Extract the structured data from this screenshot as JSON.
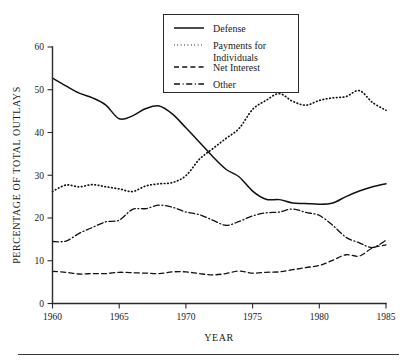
{
  "chart_data": {
    "type": "line",
    "title": "",
    "xlabel": "YEAR",
    "ylabel": "PERCENTAGE OF TOTAL OUTLAYS",
    "xlim": [
      1960,
      1985
    ],
    "ylim": [
      0,
      60
    ],
    "xticks": [
      1960,
      1965,
      1970,
      1975,
      1980,
      1985
    ],
    "xtick_labels": [
      "1960",
      "1965",
      "1970",
      "1975",
      "1980",
      "1985"
    ],
    "yticks": [
      0,
      10,
      20,
      30,
      40,
      50,
      60
    ],
    "ytick_labels": [
      "0",
      "10",
      "20",
      "30",
      "40",
      "50",
      "60"
    ],
    "grid": false,
    "legend_position": "top-center",
    "x": [
      1960,
      1961,
      1962,
      1963,
      1964,
      1965,
      1966,
      1967,
      1968,
      1969,
      1970,
      1971,
      1972,
      1973,
      1974,
      1975,
      1976,
      1977,
      1978,
      1979,
      1980,
      1981,
      1982,
      1983,
      1984,
      1985
    ],
    "series": [
      {
        "name": "Defense",
        "style": "solid",
        "values": [
          52.7,
          50.9,
          49.2,
          48.1,
          46.4,
          43.2,
          43.9,
          45.6,
          46.2,
          44.3,
          41.1,
          37.8,
          34.4,
          31.4,
          29.6,
          26.3,
          24.4,
          24.3,
          23.5,
          23.4,
          23.2,
          23.5,
          25.0,
          26.3,
          27.3,
          28.0
        ]
      },
      {
        "name": "Payments for Individuals",
        "style": "dotted",
        "values": [
          26.2,
          27.7,
          27.3,
          27.8,
          27.3,
          26.8,
          26.2,
          27.5,
          28.0,
          28.3,
          29.9,
          33.7,
          36.2,
          38.6,
          41.0,
          45.4,
          47.5,
          49.1,
          47.3,
          46.4,
          47.5,
          48.1,
          48.4,
          49.8,
          47.0,
          45.2
        ]
      },
      {
        "name": "Net Interest",
        "style": "dashed",
        "values": [
          7.5,
          7.3,
          6.9,
          7.0,
          7.0,
          7.3,
          7.2,
          7.1,
          7.0,
          7.4,
          7.4,
          7.0,
          6.7,
          7.0,
          7.6,
          7.1,
          7.3,
          7.4,
          7.9,
          8.4,
          8.9,
          10.1,
          11.4,
          11.1,
          13.0,
          13.7
        ]
      },
      {
        "name": "Other",
        "style": "dashdot",
        "values": [
          14.5,
          14.6,
          16.4,
          17.8,
          19.1,
          19.5,
          22.0,
          22.2,
          23.0,
          22.5,
          21.4,
          20.8,
          19.5,
          18.3,
          19.2,
          20.5,
          21.2,
          21.4,
          22.1,
          21.3,
          20.6,
          18.3,
          15.5,
          14.2,
          13.1,
          14.8
        ]
      }
    ]
  },
  "legend": {
    "entries": [
      {
        "label": "Defense",
        "style": "solid"
      },
      {
        "label": "Payments for",
        "label2": "Individuals",
        "style": "dotted"
      },
      {
        "label": "Net Interest",
        "style": "dashed"
      },
      {
        "label": "Other",
        "style": "dashdot"
      }
    ]
  }
}
